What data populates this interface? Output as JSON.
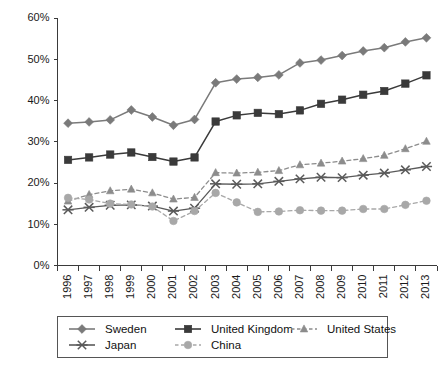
{
  "chart_data": {
    "type": "line",
    "title": "",
    "xlabel": "",
    "ylabel": "",
    "grid": false,
    "legend_position": "bottom",
    "x": [
      "1996",
      "1997",
      "1998",
      "1999",
      "2000",
      "2001",
      "2002",
      "2003",
      "2004",
      "2005",
      "2006",
      "2007",
      "2008",
      "2009",
      "2010",
      "2011",
      "2012",
      "2013"
    ],
    "categories": [
      "1996",
      "1997",
      "1998",
      "1999",
      "2000",
      "2001",
      "2002",
      "2003",
      "2004",
      "2005",
      "2006",
      "2007",
      "2008",
      "2009",
      "2010",
      "2011",
      "2012",
      "2013"
    ],
    "ylim": [
      0,
      60
    ],
    "ytick_labels": [
      "0%",
      "10%",
      "20%",
      "30%",
      "40%",
      "50%",
      "60%"
    ],
    "ytick_values": [
      0,
      10,
      20,
      30,
      40,
      50,
      60
    ],
    "y_unit": "%",
    "series": [
      {
        "name": "Sweden",
        "marker": "diamond",
        "dash": "solid",
        "color": "#7a7a7a",
        "values": [
          34.5,
          34.8,
          35.3,
          37.7,
          36.0,
          34.0,
          35.4,
          44.3,
          45.2,
          45.6,
          46.2,
          49.1,
          49.8,
          50.9,
          52.0,
          52.8,
          54.2,
          55.2
        ]
      },
      {
        "name": "United Kingdom",
        "marker": "square",
        "dash": "solid",
        "color": "#3a3a3a",
        "values": [
          25.6,
          26.2,
          26.9,
          27.4,
          26.3,
          25.2,
          26.2,
          34.9,
          36.4,
          37.0,
          36.7,
          37.6,
          39.2,
          40.2,
          41.4,
          42.3,
          44.1,
          46.1
        ]
      },
      {
        "name": "United States",
        "marker": "triangle",
        "dash": "dashed",
        "color": "#8c8c8c",
        "values": [
          15.6,
          17.2,
          18.1,
          18.5,
          17.6,
          16.1,
          16.5,
          22.5,
          22.4,
          22.6,
          23.0,
          24.4,
          24.8,
          25.3,
          25.9,
          26.7,
          28.3,
          30.1
        ]
      },
      {
        "name": "Japan",
        "marker": "x",
        "dash": "solid",
        "color": "#5a5a5a",
        "values": [
          13.5,
          14.1,
          14.6,
          14.7,
          14.4,
          13.2,
          13.9,
          19.8,
          19.7,
          19.8,
          20.4,
          21.0,
          21.4,
          21.3,
          21.9,
          22.4,
          23.2,
          24.0
        ]
      },
      {
        "name": "China",
        "marker": "circle",
        "dash": "dashed",
        "color": "#a8a8a8",
        "values": [
          16.4,
          16.0,
          15.0,
          14.8,
          14.3,
          10.8,
          13.2,
          17.6,
          15.3,
          13.0,
          13.1,
          13.4,
          13.3,
          13.3,
          13.7,
          13.7,
          14.7,
          15.7
        ]
      }
    ]
  },
  "legend": {
    "entries": [
      {
        "label": "Sweden"
      },
      {
        "label": "United Kingdom"
      },
      {
        "label": "United States"
      },
      {
        "label": "Japan"
      },
      {
        "label": "China"
      }
    ]
  }
}
